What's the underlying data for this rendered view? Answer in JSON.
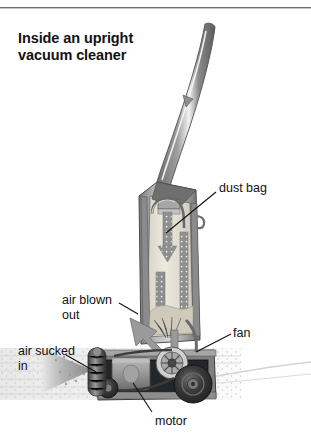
{
  "figure": {
    "title_line1": "Inside an upright",
    "title_line2": "vacuum cleaner",
    "type": "cutaway-illustration",
    "palette": {
      "background": "#ffffff",
      "rule": "#6f6f6f",
      "ink": "#111111",
      "body_dark": "#5a5a5a",
      "body_mid": "#8d8d8d",
      "body_light": "#c9c9c9",
      "bag_fill": "#e6e2d6",
      "carpet": "#efefef",
      "arrow_gray": "#9a9a9a"
    },
    "top_rule": true
  },
  "labels": [
    {
      "id": "dust-bag",
      "text": "dust bag",
      "x": 219,
      "y": 181,
      "leader_to_x": 165,
      "leader_to_y": 232
    },
    {
      "id": "air-blown",
      "text": "air blown\nout",
      "line1": "air blown",
      "line2": "out",
      "x": 62,
      "y": 293,
      "leader_to_x": 130,
      "leader_to_y": 318
    },
    {
      "id": "air-sucked",
      "text": "air sucked\nin",
      "line1": "air sucked",
      "line2": "in",
      "x": 18,
      "y": 344,
      "leader_to_x": 92,
      "leader_to_y": 370
    },
    {
      "id": "fan",
      "text": "fan",
      "x": 233,
      "y": 326,
      "leader_to_x": 178,
      "leader_to_y": 352
    },
    {
      "id": "motor",
      "text": "motor",
      "x": 155,
      "y": 414,
      "leader_to_x": 133,
      "leader_to_y": 382
    }
  ],
  "parts": [
    {
      "id": "handle",
      "name": "curved handle"
    },
    {
      "id": "dust-bag",
      "name": "dust bag"
    },
    {
      "id": "fan",
      "name": "fan"
    },
    {
      "id": "motor",
      "name": "motor"
    },
    {
      "id": "wheel-rear",
      "name": "rear wheel"
    },
    {
      "id": "brush-roller",
      "name": "brush roller"
    },
    {
      "id": "carpet",
      "name": "carpet / floor"
    }
  ]
}
